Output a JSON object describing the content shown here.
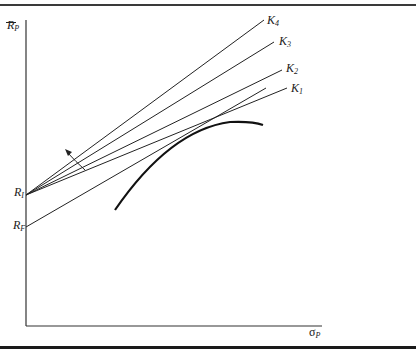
{
  "figure": {
    "type": "diagram",
    "y_axis": {
      "label_main": "R",
      "label_sub": "P",
      "bar": true
    },
    "x_axis": {
      "label_main": "σ",
      "label_sub": "P"
    },
    "intercepts": [
      {
        "main": "R",
        "sub": "I"
      },
      {
        "main": "R",
        "sub": "F"
      }
    ],
    "lines": [
      {
        "main": "K",
        "sub": "4"
      },
      {
        "main": "K",
        "sub": "3"
      },
      {
        "main": "K",
        "sub": "2"
      },
      {
        "main": "K",
        "sub": "1"
      }
    ],
    "curve": "efficient-frontier",
    "arrow": "rotation-direction"
  }
}
